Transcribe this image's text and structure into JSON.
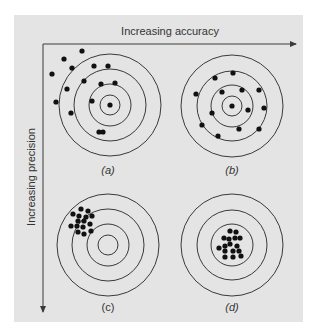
{
  "colors": {
    "background": "#ffffff",
    "panel": "#e4e4e4",
    "line": "#3a3a3a",
    "dot": "#111111",
    "text": "#333333"
  },
  "axes": {
    "x_label": "Increasing accuracy",
    "y_label": "Increasing precision",
    "origin": [
      43,
      44
    ],
    "x_end": [
      296,
      44
    ],
    "y_end": [
      43,
      312
    ]
  },
  "ring_radii": [
    51,
    36,
    21,
    10
  ],
  "dot_radius": 2.6,
  "targets": [
    {
      "id": "a",
      "label": "(a)",
      "label_italic": true,
      "center": [
        110,
        105
      ],
      "label_pos": [
        108,
        174
      ],
      "rings_visible": [
        51,
        36,
        21,
        10
      ],
      "dots": [
        [
          82,
          51
        ],
        [
          64,
          59
        ],
        [
          72,
          68
        ],
        [
          52,
          74
        ],
        [
          94,
          66
        ],
        [
          108,
          66
        ],
        [
          84,
          81
        ],
        [
          101,
          84
        ],
        [
          115,
          83
        ],
        [
          67,
          89
        ],
        [
          92,
          101
        ],
        [
          56,
          102
        ],
        [
          110,
          105
        ],
        [
          71,
          113
        ],
        [
          99,
          132
        ],
        [
          103,
          132
        ]
      ]
    },
    {
      "id": "b",
      "label": "(b)",
      "label_italic": true,
      "center": [
        232,
        106
      ],
      "label_pos": [
        232,
        174
      ],
      "rings_visible": [
        51,
        35,
        21,
        10
      ],
      "dots": [
        [
          233,
          73
        ],
        [
          215,
          78
        ],
        [
          196,
          94
        ],
        [
          222,
          92
        ],
        [
          242,
          90
        ],
        [
          259,
          90
        ],
        [
          232,
          106
        ],
        [
          248,
          110
        ],
        [
          264,
          108
        ],
        [
          212,
          113
        ],
        [
          202,
          125
        ],
        [
          239,
          129
        ],
        [
          259,
          129
        ],
        [
          218,
          136
        ]
      ]
    },
    {
      "id": "c",
      "label": "(c)",
      "label_italic": false,
      "center": [
        108,
        245
      ],
      "label_pos": [
        108,
        311
      ],
      "rings_visible": [
        51,
        36,
        21,
        10
      ],
      "dots": [
        [
          81,
          209
        ],
        [
          88,
          211
        ],
        [
          73,
          214
        ],
        [
          79,
          216
        ],
        [
          86,
          217
        ],
        [
          92,
          216
        ],
        [
          78,
          221
        ],
        [
          84,
          221
        ],
        [
          71,
          226
        ],
        [
          77,
          226
        ],
        [
          83,
          227
        ],
        [
          90,
          224
        ],
        [
          78,
          232
        ],
        [
          84,
          234
        ],
        [
          91,
          231
        ]
      ]
    },
    {
      "id": "d",
      "label": "(d)",
      "label_italic": true,
      "center": [
        232,
        245
      ],
      "label_pos": [
        232,
        311
      ],
      "rings_visible": [
        51,
        35,
        21
      ],
      "dots": [
        [
          230,
          231
        ],
        [
          236,
          232
        ],
        [
          224,
          238
        ],
        [
          229,
          239
        ],
        [
          235,
          238
        ],
        [
          240,
          238
        ],
        [
          219,
          248
        ],
        [
          225,
          246
        ],
        [
          230,
          244
        ],
        [
          237,
          246
        ],
        [
          225,
          251
        ],
        [
          233,
          251
        ],
        [
          239,
          251
        ],
        [
          225,
          257
        ],
        [
          233,
          257
        ],
        [
          241,
          256
        ]
      ]
    }
  ]
}
